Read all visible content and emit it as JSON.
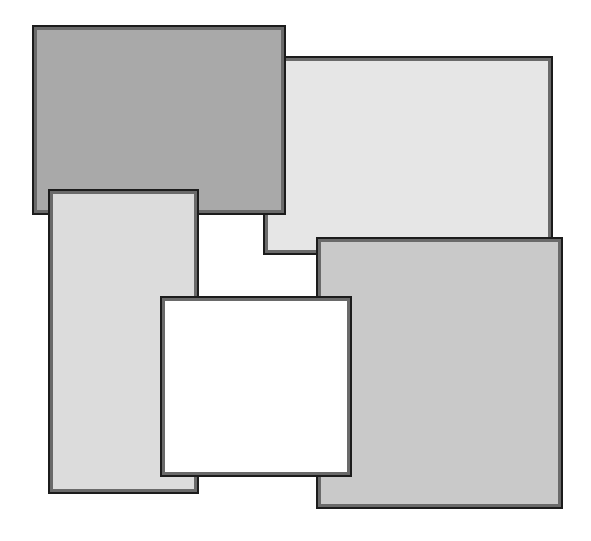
{
  "canvas": {
    "width": 591,
    "height": 541,
    "background": "#ffffff"
  },
  "border": {
    "outer_color": "#1c1c1c",
    "inner_color": "#6a6a6a"
  },
  "rectangles": [
    {
      "id": "rect-top-right",
      "x": 263,
      "y": 56,
      "w": 290,
      "h": 199,
      "fill": "#e6e6e6",
      "z": 1
    },
    {
      "id": "rect-top-left",
      "x": 32,
      "y": 25,
      "w": 254,
      "h": 190,
      "fill": "#a9a9a9",
      "z": 2
    },
    {
      "id": "rect-left-tall",
      "x": 48,
      "y": 189,
      "w": 151,
      "h": 305,
      "fill": "#dcdcdc",
      "z": 3
    },
    {
      "id": "rect-bottom-right",
      "x": 316,
      "y": 237,
      "w": 247,
      "h": 272,
      "fill": "#c9c9c9",
      "z": 4
    },
    {
      "id": "rect-center-white",
      "x": 160,
      "y": 296,
      "w": 192,
      "h": 181,
      "fill": "#ffffff",
      "z": 5
    }
  ]
}
